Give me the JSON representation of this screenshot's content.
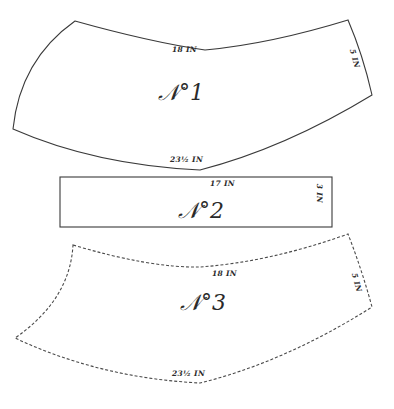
{
  "diagram": {
    "pieces": [
      {
        "id": "1",
        "title": "𝒩°1",
        "outline": "solid",
        "top_edge": "18 IN",
        "side_edge": "5 IN",
        "bottom_edge": "23½ IN"
      },
      {
        "id": "2",
        "title": "𝒩°2",
        "outline": "solid",
        "top_edge": "17 IN",
        "side_edge": "3 IN"
      },
      {
        "id": "3",
        "title": "𝒩°3",
        "outline": "dashed",
        "top_edge": "18 IN",
        "side_edge": "5 IN",
        "bottom_edge": "23½ IN"
      }
    ]
  }
}
